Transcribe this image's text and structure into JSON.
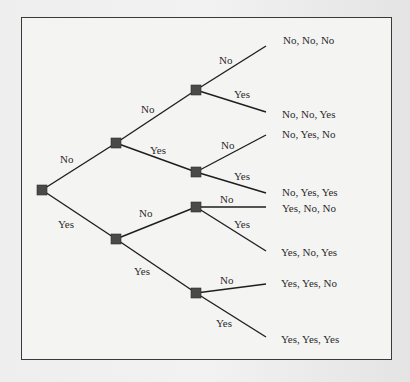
{
  "diagram": {
    "type": "probability-tree",
    "levels": 3,
    "colors": {
      "edge": "#1e1e1e",
      "node": "#4a4a4a",
      "frame_border": "#3a3a3a",
      "frame_fill": "#f4f4f3",
      "text": "#2a2a2a"
    },
    "root": {
      "branches": [
        {
          "label": "No",
          "branches": [
            {
              "label": "No",
              "branches": [
                {
                  "label": "No",
                  "outcome": "No, No, No"
                },
                {
                  "label": "Yes",
                  "outcome": "No, No, Yes"
                }
              ]
            },
            {
              "label": "Yes",
              "branches": [
                {
                  "label": "No",
                  "outcome": "No, Yes, No"
                },
                {
                  "label": "Yes",
                  "outcome": "No, Yes, Yes"
                }
              ]
            }
          ]
        },
        {
          "label": "Yes",
          "branches": [
            {
              "label": "No",
              "branches": [
                {
                  "label": "No",
                  "outcome": "Yes, No, No"
                },
                {
                  "label": "Yes",
                  "outcome": "Yes, No, Yes"
                }
              ]
            },
            {
              "label": "Yes",
              "branches": [
                {
                  "label": "No",
                  "outcome": "Yes, Yes, No"
                },
                {
                  "label": "Yes",
                  "outcome": "Yes, Yes, Yes"
                }
              ]
            }
          ]
        }
      ]
    },
    "outcomes": [
      "No, No, No",
      "No, No, Yes",
      "No, Yes, No",
      "No, Yes, Yes",
      "Yes, No, No",
      "Yes, No, Yes",
      "Yes, Yes, No",
      "Yes, Yes, Yes"
    ]
  }
}
